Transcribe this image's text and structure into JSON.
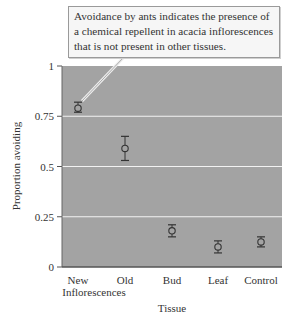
{
  "annotation": {
    "text": "Avoidance by ants indicates the presence of a chemical repellent in acacia inflorescences that is not present in other tissues."
  },
  "chart_data": {
    "type": "scatter",
    "title": "",
    "xlabel": "Tissue",
    "ylabel": "Proportion avoiding",
    "ylim": [
      0,
      1
    ],
    "yticks": [
      0,
      0.25,
      0.5,
      0.75,
      1
    ],
    "ytick_labels": [
      "0",
      "0.25",
      "0.5",
      "0.75",
      "1"
    ],
    "grid": true,
    "background": "#a3a3a3",
    "categories": [
      "New Inflorescences",
      "Old",
      "Bud",
      "Leaf",
      "Control"
    ],
    "category_lines": [
      [
        "New",
        "Inflorescences"
      ],
      [
        "Old"
      ],
      [
        "Bud"
      ],
      [
        "Leaf"
      ],
      [
        "Control"
      ]
    ],
    "values": [
      0.79,
      0.59,
      0.18,
      0.1,
      0.125
    ],
    "error_low": [
      0.77,
      0.53,
      0.15,
      0.07,
      0.1
    ],
    "error_high": [
      0.82,
      0.65,
      0.21,
      0.13,
      0.15
    ],
    "annotation_target": "New Inflorescences"
  }
}
